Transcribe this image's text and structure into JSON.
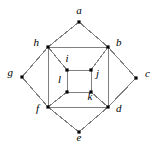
{
  "figure": {
    "kind": "undirected-graph-diagram",
    "background_color": "#ffffff",
    "edge_color": "#808080",
    "vertex_color": "#000000",
    "label_color": "#000000",
    "width": 158,
    "height": 155
  },
  "vertices": [
    {
      "id": "a",
      "label": "a",
      "x": 79,
      "y": 22,
      "label_x": 79,
      "label_y": 10,
      "label_anchor": "center"
    },
    {
      "id": "b",
      "label": "b",
      "x": 108,
      "y": 47,
      "label_x": 116,
      "label_y": 42,
      "label_anchor": "left"
    },
    {
      "id": "c",
      "label": "c",
      "x": 136,
      "y": 78,
      "label_x": 145,
      "label_y": 73,
      "label_anchor": "left"
    },
    {
      "id": "d",
      "label": "d",
      "x": 108,
      "y": 107,
      "label_x": 116,
      "label_y": 108,
      "label_anchor": "left"
    },
    {
      "id": "e",
      "label": "e",
      "x": 79,
      "y": 132,
      "label_x": 79,
      "label_y": 137,
      "label_anchor": "center"
    },
    {
      "id": "f",
      "label": "f",
      "x": 48,
      "y": 107,
      "label_x": 39,
      "label_y": 108,
      "label_anchor": "right"
    },
    {
      "id": "g",
      "label": "g",
      "x": 22,
      "y": 77,
      "label_x": 13,
      "label_y": 72,
      "label_anchor": "right"
    },
    {
      "id": "h",
      "label": "h",
      "x": 48,
      "y": 47,
      "label_x": 39,
      "label_y": 42,
      "label_anchor": "right"
    },
    {
      "id": "i",
      "label": "i",
      "x": 67,
      "y": 70,
      "label_x": 67,
      "label_y": 58,
      "label_anchor": "center"
    },
    {
      "id": "j",
      "label": "j",
      "x": 91,
      "y": 70,
      "label_x": 96,
      "label_y": 73,
      "label_anchor": "left"
    },
    {
      "id": "k",
      "label": "k",
      "x": 91,
      "y": 92,
      "label_x": 90,
      "label_y": 96,
      "label_anchor": "center"
    },
    {
      "id": "l",
      "label": "l",
      "x": 67,
      "y": 92,
      "label_x": 61,
      "label_y": 79,
      "label_anchor": "right"
    }
  ],
  "edges": [
    {
      "from": "a",
      "to": "h",
      "group": "outer-diamond"
    },
    {
      "from": "a",
      "to": "b",
      "group": "outer-diamond"
    },
    {
      "from": "b",
      "to": "c",
      "group": "outer-diamond"
    },
    {
      "from": "c",
      "to": "d",
      "group": "outer-diamond"
    },
    {
      "from": "d",
      "to": "e",
      "group": "outer-diamond"
    },
    {
      "from": "e",
      "to": "f",
      "group": "outer-diamond"
    },
    {
      "from": "f",
      "to": "g",
      "group": "outer-diamond"
    },
    {
      "from": "g",
      "to": "h",
      "group": "outer-diamond"
    },
    {
      "from": "h",
      "to": "b",
      "group": "middle-square"
    },
    {
      "from": "b",
      "to": "d",
      "group": "middle-square"
    },
    {
      "from": "d",
      "to": "f",
      "group": "middle-square"
    },
    {
      "from": "f",
      "to": "h",
      "group": "middle-square"
    },
    {
      "from": "i",
      "to": "j",
      "group": "inner-square"
    },
    {
      "from": "j",
      "to": "k",
      "group": "inner-square"
    },
    {
      "from": "k",
      "to": "l",
      "group": "inner-square"
    },
    {
      "from": "l",
      "to": "i",
      "group": "inner-square"
    },
    {
      "from": "h",
      "to": "i",
      "group": "spoke"
    },
    {
      "from": "b",
      "to": "j",
      "group": "spoke"
    },
    {
      "from": "d",
      "to": "k",
      "group": "spoke"
    },
    {
      "from": "f",
      "to": "l",
      "group": "spoke"
    }
  ]
}
